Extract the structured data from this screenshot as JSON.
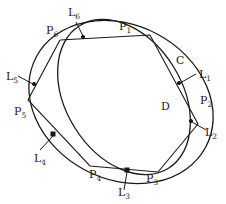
{
  "figure": {
    "curves": [
      {
        "id": "C",
        "label": "C",
        "description": "outer closed curve"
      },
      {
        "id": "D",
        "label": "D",
        "description": "inner closed curve"
      }
    ],
    "points": [
      {
        "id": "P1",
        "base": "P",
        "sub": "1"
      },
      {
        "id": "P2",
        "base": "P",
        "sub": "2"
      },
      {
        "id": "P3",
        "base": "P",
        "sub": "3"
      },
      {
        "id": "P4",
        "base": "P",
        "sub": "4"
      },
      {
        "id": "P5",
        "base": "P",
        "sub": "5"
      },
      {
        "id": "P6",
        "base": "P",
        "sub": "6"
      }
    ],
    "lines": [
      {
        "id": "L1",
        "base": "L",
        "sub": "1"
      },
      {
        "id": "L2",
        "base": "L",
        "sub": "2"
      },
      {
        "id": "L3",
        "base": "L",
        "sub": "3"
      },
      {
        "id": "L4",
        "base": "L",
        "sub": "4"
      },
      {
        "id": "L5",
        "base": "L",
        "sub": "5"
      },
      {
        "id": "L6",
        "base": "L",
        "sub": "6"
      }
    ],
    "caption_fragment": "· · ·"
  }
}
